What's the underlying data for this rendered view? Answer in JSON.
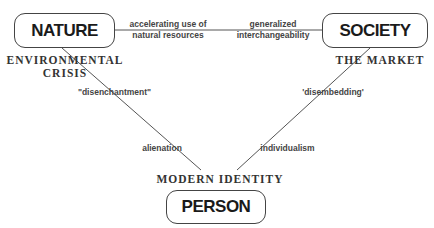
{
  "nodes": {
    "nature": "NATURE",
    "society": "SOCIETY",
    "person": "PERSON"
  },
  "node_captions": {
    "nature": [
      "ENVIRONMENTAL",
      "CRISIS"
    ],
    "society": "THE MARKET",
    "person": "MODERN IDENTITY"
  },
  "edges": {
    "nature_society": {
      "left_label": [
        "accelerating use of",
        "natural resources"
      ],
      "right_label": [
        "generalized",
        "interchangeability"
      ]
    },
    "nature_person": {
      "upper_label": "\"disenchantment\"",
      "lower_label": "alienation"
    },
    "society_person": {
      "upper_label": "'disembedding'",
      "lower_label": "individualism"
    }
  }
}
